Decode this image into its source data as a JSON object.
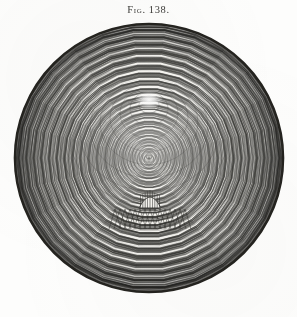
{
  "plate": {
    "caption_prefix": "Fig.",
    "caption_number": "138.",
    "caption_full": "Fig. 138.",
    "background_color": "#fdfdfc",
    "ink_color": "#2b2a27"
  },
  "figure": {
    "name": "harmonograph-lissajous-disc",
    "center_x": 149,
    "center_y": 158,
    "radius": 134,
    "rim_color": "#24231f",
    "rim_width": 3
  },
  "chart_data": {
    "type": "line",
    "subtitle": "",
    "xlabel": "",
    "ylabel": "",
    "grid": false,
    "legend": null,
    "plot_kind": "harmonograph-rose",
    "axis_ranges": {
      "x": [
        -1,
        1
      ],
      "y": [
        -1,
        1
      ]
    },
    "annotations": [
      {
        "label": "central node",
        "x": 149,
        "y": 100
      },
      {
        "label": "secondary node crown",
        "x": 150,
        "y": 199
      }
    ],
    "series": [
      {
        "name": "spiral-family-a",
        "windings": 96,
        "phase_deg": 0,
        "decay": 0.0,
        "stroke": "#2b2a27",
        "stroke_width": 0.38,
        "opacity": 0.85
      },
      {
        "name": "spiral-family-b",
        "windings": 96,
        "phase_deg": 180,
        "decay": 0.0,
        "stroke": "#2b2a27",
        "stroke_width": 0.38,
        "opacity": 0.85
      },
      {
        "name": "concentric-rings",
        "count": 14,
        "stroke": "#23221f",
        "stroke_width": 0.55,
        "opacity": 0.55
      }
    ],
    "ring_radii": [
      10,
      19,
      29,
      39,
      49,
      59,
      69,
      79,
      89,
      99,
      109,
      118,
      126,
      132
    ],
    "lobe_count": 64,
    "values": [
      10,
      19,
      29,
      39,
      49,
      59,
      69,
      79,
      89,
      99,
      109,
      118,
      126,
      132
    ],
    "categories": [
      "r1",
      "r2",
      "r3",
      "r4",
      "r5",
      "r6",
      "r7",
      "r8",
      "r9",
      "r10",
      "r11",
      "r12",
      "r13",
      "r14"
    ]
  }
}
